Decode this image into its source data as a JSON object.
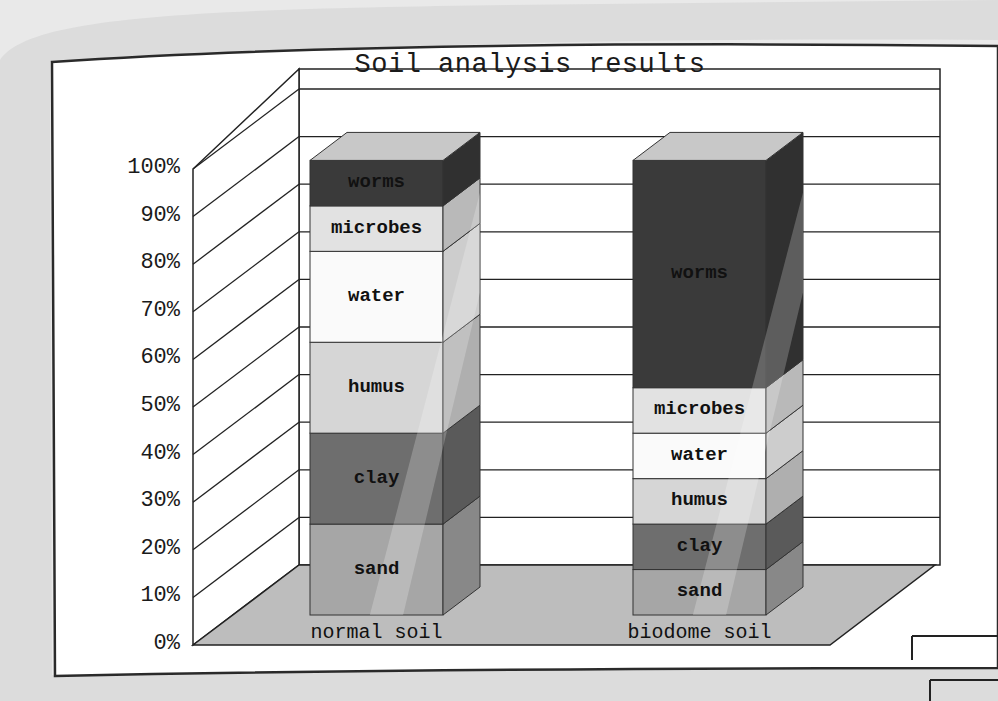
{
  "chart_data": {
    "type": "bar",
    "subtype": "stacked-3d-percent",
    "title": "Soil analysis results",
    "xlabel": "",
    "ylabel": "",
    "ylim": [
      0,
      100
    ],
    "y_ticks": [
      "0%",
      "10%",
      "20%",
      "30%",
      "40%",
      "50%",
      "60%",
      "70%",
      "80%",
      "90%",
      "100%"
    ],
    "grid": true,
    "legend": "inline segment labels",
    "categories": [
      "normal soil",
      "biodome soil"
    ],
    "series": [
      {
        "name": "sand",
        "values": [
          20,
          10
        ],
        "color": "#a6a6a6"
      },
      {
        "name": "clay",
        "values": [
          20,
          10
        ],
        "color": "#6e6e6e"
      },
      {
        "name": "humus",
        "values": [
          20,
          10
        ],
        "color": "#d6d6d6"
      },
      {
        "name": "water",
        "values": [
          20,
          10
        ],
        "color": "#fafafa"
      },
      {
        "name": "microbes",
        "values": [
          10,
          10
        ],
        "color": "#e2e2e2"
      },
      {
        "name": "worms",
        "values": [
          10,
          50
        ],
        "color": "#3a3a3a"
      }
    ]
  },
  "colors": {
    "floor": "#bdbdbd",
    "grid_line": "#1f1f1f",
    "paper": "#ffffff",
    "background": "#e9e9e9"
  }
}
